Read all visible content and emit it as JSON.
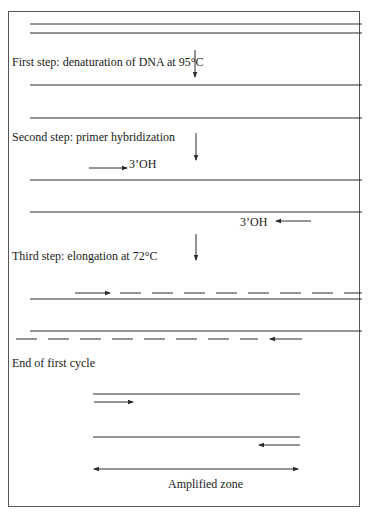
{
  "diagram": {
    "steps": [
      {
        "id": "step1",
        "label": "First step: denaturation of DNA at 95°C"
      },
      {
        "id": "step2",
        "label": "Second step: primer hybridization"
      },
      {
        "id": "step3",
        "label": "Third step: elongation at 72°C"
      },
      {
        "id": "end",
        "label": "End of first cycle"
      }
    ],
    "primer_end_labels": {
      "forward": "3’OH",
      "reverse": "3’OH"
    },
    "amplified_zone_label": "Amplified zone",
    "colors": {
      "line": "#2a2a2a",
      "frame": "#555555",
      "background": "#ffffff"
    }
  }
}
